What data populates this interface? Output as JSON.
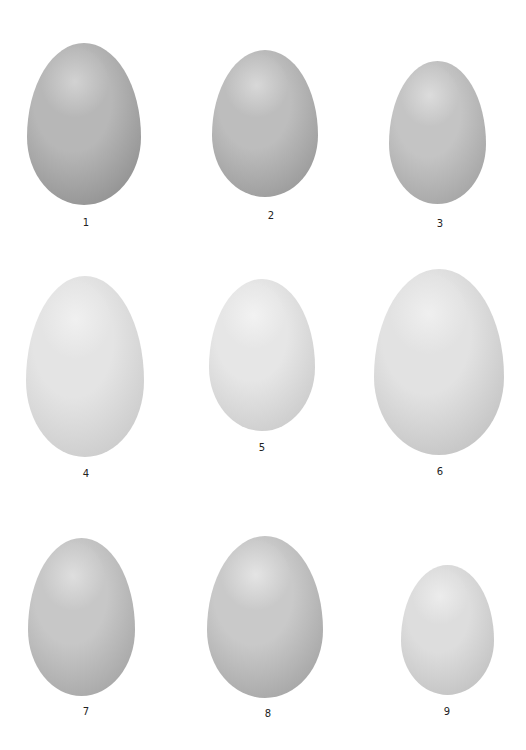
{
  "plate": {
    "eggs": [
      {
        "label": "1",
        "x": 27,
        "y": 43,
        "w": 114,
        "h": 162,
        "base": "#b7b7b7",
        "dark": "#8a8a8a",
        "light": "#d2d2d2",
        "lx": 86,
        "ly": 217
      },
      {
        "label": "2",
        "x": 212,
        "y": 50,
        "w": 106,
        "h": 147,
        "base": "#bdbdbd",
        "dark": "#939393",
        "light": "#d8d8d8",
        "lx": 271,
        "ly": 210
      },
      {
        "label": "3",
        "x": 389,
        "y": 61,
        "w": 97,
        "h": 143,
        "base": "#c4c4c4",
        "dark": "#9e9e9e",
        "light": "#dcdcdc",
        "lx": 440,
        "ly": 218
      },
      {
        "label": "4",
        "x": 26,
        "y": 276,
        "w": 118,
        "h": 181,
        "base": "#e4e4e4",
        "dark": "#c6c6c6",
        "light": "#f0f0f0",
        "lx": 86,
        "ly": 468
      },
      {
        "label": "5",
        "x": 209,
        "y": 279,
        "w": 106,
        "h": 152,
        "base": "#e6e6e6",
        "dark": "#c6c6c6",
        "light": "#f2f2f2",
        "lx": 262,
        "ly": 442
      },
      {
        "label": "6",
        "x": 374,
        "y": 269,
        "w": 130,
        "h": 186,
        "base": "#e2e2e2",
        "dark": "#bdbdbd",
        "light": "#efefef",
        "lx": 440,
        "ly": 466
      },
      {
        "label": "7",
        "x": 28,
        "y": 538,
        "w": 107,
        "h": 158,
        "base": "#c7c7c7",
        "dark": "#a0a0a0",
        "light": "#dedede",
        "lx": 86,
        "ly": 706
      },
      {
        "label": "8",
        "x": 207,
        "y": 536,
        "w": 116,
        "h": 162,
        "base": "#c9c9c9",
        "dark": "#9e9e9e",
        "light": "#e4e4e4",
        "lx": 268,
        "ly": 708
      },
      {
        "label": "9",
        "x": 401,
        "y": 565,
        "w": 93,
        "h": 130,
        "base": "#dddddd",
        "dark": "#bdbdbd",
        "light": "#ececec",
        "lx": 447,
        "ly": 706
      }
    ]
  }
}
